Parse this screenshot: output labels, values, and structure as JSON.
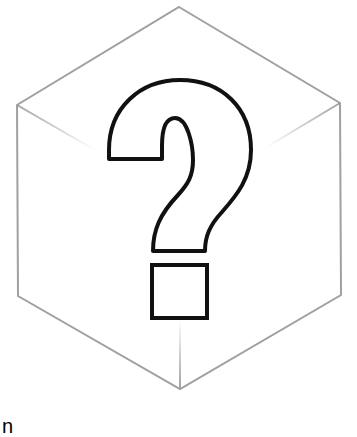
{
  "image": {
    "subject": "question-mark-in-cube",
    "description": "Outlined isometric cube (hexagon) containing a large outlined question mark"
  },
  "caption": {
    "text": "n"
  },
  "colors": {
    "background": "#ffffff",
    "cube_stroke": "#a0a0a0",
    "question_stroke": "#111111",
    "question_fill": "#ffffff"
  }
}
